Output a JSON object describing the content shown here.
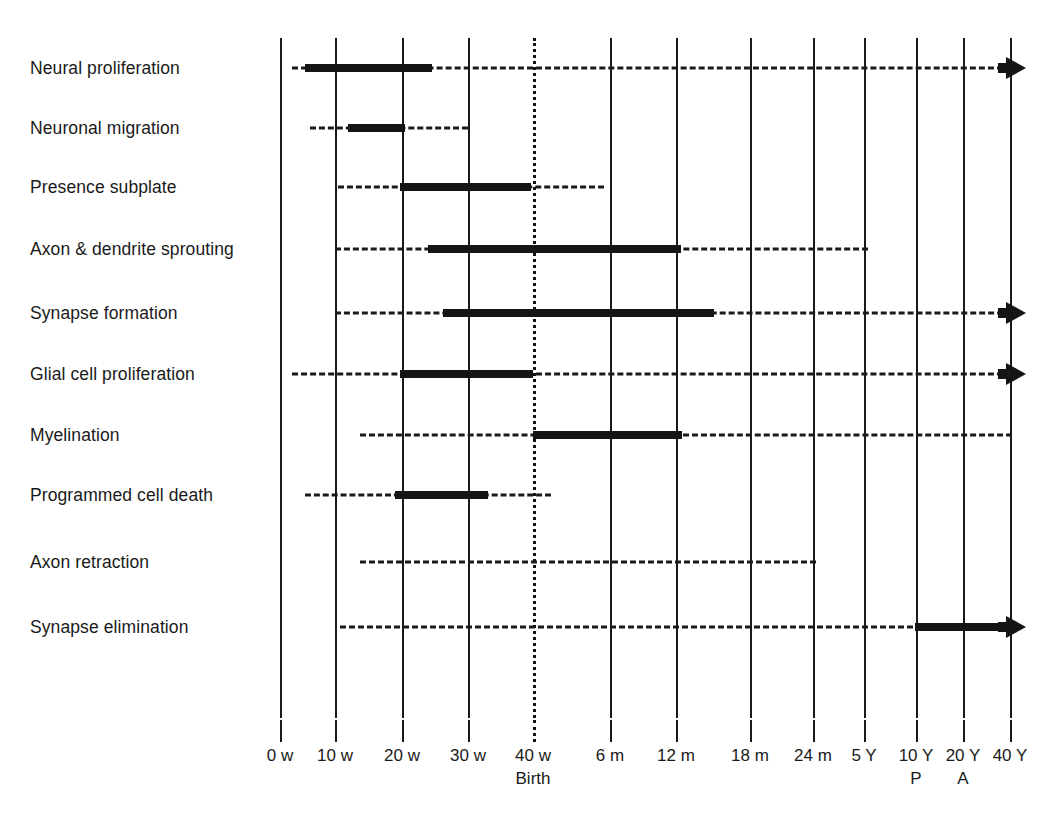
{
  "chart_data": {
    "type": "table",
    "title": "",
    "xlabel": "",
    "ylabel": "",
    "grid": true,
    "legend": "none",
    "axis_ticks": [
      {
        "label": "0 w",
        "sublabel": "",
        "x": 280
      },
      {
        "label": "10 w",
        "sublabel": "",
        "x": 335
      },
      {
        "label": "20 w",
        "sublabel": "",
        "x": 402
      },
      {
        "label": "30 w",
        "sublabel": "",
        "x": 468
      },
      {
        "label": "40 w",
        "sublabel": "Birth",
        "x": 533,
        "style": "dotted"
      },
      {
        "label": "6 m",
        "sublabel": "",
        "x": 610
      },
      {
        "label": "12 m",
        "sublabel": "",
        "x": 676
      },
      {
        "label": "18 m",
        "sublabel": "",
        "x": 750
      },
      {
        "label": "24 m",
        "sublabel": "",
        "x": 813
      },
      {
        "label": "5 Y",
        "sublabel": "",
        "x": 864
      },
      {
        "label": "10 Y",
        "sublabel": "P",
        "x": 916
      },
      {
        "label": "20 Y",
        "sublabel": "A",
        "x": 963
      },
      {
        "label": "40 Y",
        "sublabel": "",
        "x": 1010
      }
    ],
    "categories": [
      "Neural proliferation",
      "Neuronal migration",
      "Presence subplate",
      "Axon & dendrite sprouting",
      "Synapse formation",
      "Glial cell proliferation",
      "Myelination",
      "Programmed cell death",
      "Axon retraction",
      "Synapse elimination"
    ],
    "rows": [
      {
        "label": "Neural proliferation",
        "y": 68,
        "dashed_start": 292,
        "dashed_end": 1012,
        "bar_start": 305,
        "bar_end": 432,
        "arrow": true
      },
      {
        "label": "Neuronal migration",
        "y": 128,
        "dashed_start": 310,
        "dashed_end": 468,
        "bar_start": 348,
        "bar_end": 405,
        "arrow": false
      },
      {
        "label": "Presence subplate",
        "y": 187,
        "dashed_start": 338,
        "dashed_end": 604,
        "bar_start": 400,
        "bar_end": 531,
        "arrow": false
      },
      {
        "label": "Axon & dendrite sprouting",
        "y": 249,
        "dashed_start": 335,
        "dashed_end": 868,
        "bar_start": 428,
        "bar_end": 681,
        "arrow": false
      },
      {
        "label": "Synapse formation",
        "y": 313,
        "dashed_start": 335,
        "dashed_end": 1012,
        "bar_start": 443,
        "bar_end": 714,
        "arrow": true
      },
      {
        "label": "Glial cell proliferation",
        "y": 374,
        "dashed_start": 292,
        "dashed_end": 1012,
        "bar_start": 400,
        "bar_end": 533,
        "arrow": true
      },
      {
        "label": "Myelination",
        "y": 435,
        "dashed_start": 360,
        "dashed_end": 1012,
        "bar_start": 533,
        "bar_end": 682,
        "arrow": false
      },
      {
        "label": "Programmed cell death",
        "y": 495,
        "dashed_start": 305,
        "dashed_end": 551,
        "bar_start": 395,
        "bar_end": 488,
        "arrow": false
      },
      {
        "label": "Axon retraction",
        "y": 562,
        "dashed_start": 360,
        "dashed_end": 816,
        "bar_start": null,
        "bar_end": null,
        "arrow": false
      },
      {
        "label": "Synapse elimination",
        "y": 627,
        "dashed_start": 340,
        "dashed_end": 1012,
        "bar_start": 915,
        "bar_end": 1002,
        "arrow": true
      }
    ],
    "grid_top": 38,
    "grid_bottom": 718,
    "colors": {
      "line": "#1a1a1a",
      "bar": "#151515",
      "background": "#ffffff"
    }
  }
}
